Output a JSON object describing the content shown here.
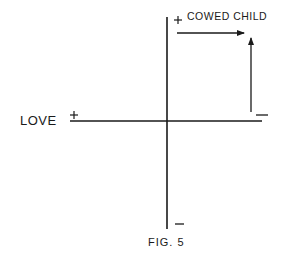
{
  "figure": {
    "caption": "FIG. 5",
    "x_axis_label": "LOVE",
    "quadrant_label": "COWED CHILD",
    "signs": {
      "x_positive": "+",
      "x_negative": "−",
      "y_positive": "+",
      "y_negative": "−"
    },
    "colors": {
      "line": "#1a1a1a",
      "background": "#ffffff"
    }
  }
}
